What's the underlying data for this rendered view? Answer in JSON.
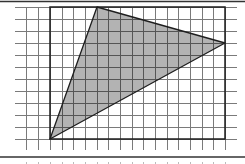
{
  "diagram": {
    "type": "grid-geometry",
    "grid": {
      "columns_x": [
        26,
        38,
        50,
        62,
        73,
        85,
        97,
        108,
        120,
        132,
        143,
        155,
        167,
        178,
        190,
        202,
        213,
        225
      ],
      "rows_y": [
        7,
        19,
        31,
        43,
        55,
        67,
        79,
        91,
        103,
        115,
        127,
        139
      ],
      "h_line_extent": [
        15,
        237
      ],
      "v_line_extent": [
        7,
        150
      ],
      "line_color": "#7a7a7a"
    },
    "rectangle": {
      "x": 50,
      "y": 7,
      "width": 175,
      "height": 132,
      "cells_wide": 15,
      "cells_high": 11,
      "stroke": "#1e1e1e"
    },
    "triangle": {
      "vertices": [
        {
          "label": "top",
          "x": 97,
          "y": 7,
          "grid_col": 4,
          "grid_row": 0
        },
        {
          "label": "right",
          "x": 225,
          "y": 43,
          "grid_col": 15,
          "grid_row": 3
        },
        {
          "label": "bottom-left",
          "x": 50,
          "y": 139,
          "grid_col": 0,
          "grid_row": 11
        }
      ],
      "fill": "#b3b3b3",
      "stroke": "#1e1e1e",
      "inner_grid_color": "#555555"
    },
    "frame": {
      "top_border_y": 1.5,
      "bottom_separator_y": 157,
      "color": "#333333"
    },
    "bottom_ticks": {
      "y": 162,
      "color": "#bbbbbb"
    }
  }
}
